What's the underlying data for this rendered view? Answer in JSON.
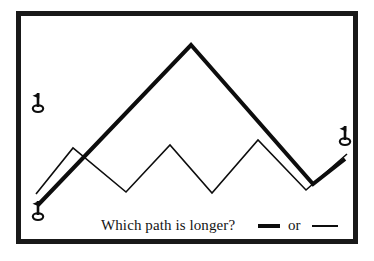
{
  "figure": {
    "title": "Which path is longer?",
    "background_color": "#ffffff",
    "frame_color": "#191919",
    "ink_color": "#0d0d0d",
    "width": 374,
    "height": 261
  },
  "caption": {
    "question": "Which path is longer?",
    "or_label": "or",
    "thick_swatch_name": "thick-line-sample",
    "thin_swatch_name": "thin-line-sample"
  },
  "markers": [
    {
      "name": "flag-marker-upper-left",
      "icon": "golf-flag-icon",
      "x": 38,
      "y": 106
    },
    {
      "name": "flag-marker-lower-left",
      "icon": "golf-flag-icon",
      "x": 38,
      "y": 214
    },
    {
      "name": "flag-marker-right",
      "icon": "golf-flag-icon",
      "x": 345,
      "y": 139
    }
  ],
  "chart_data": {
    "type": "line",
    "title": "Which path is longer?",
    "xlabel": "",
    "ylabel": "",
    "xlim": [
      0,
      374
    ],
    "ylim": [
      261,
      0
    ],
    "grid": false,
    "legend": [
      "thick",
      "thin"
    ],
    "legend_position": "bottom",
    "annotation": "Optical illusion: both zigzag paths span the same endpoints.",
    "series": [
      {
        "name": "thick-path",
        "label": "thick",
        "stroke_width": 4,
        "color": "#0d0d0d",
        "points": [
          [
            38,
            205
          ],
          [
            191,
            45
          ],
          [
            313,
            184
          ],
          [
            345,
            159
          ]
        ]
      },
      {
        "name": "thin-path",
        "label": "thin",
        "stroke_width": 1.6,
        "color": "#0d0d0d",
        "points": [
          [
            36,
            194
          ],
          [
            73,
            148
          ],
          [
            126,
            192
          ],
          [
            170,
            145
          ],
          [
            212,
            193
          ],
          [
            258,
            140
          ],
          [
            306,
            190
          ],
          [
            347,
            154
          ]
        ]
      }
    ]
  }
}
